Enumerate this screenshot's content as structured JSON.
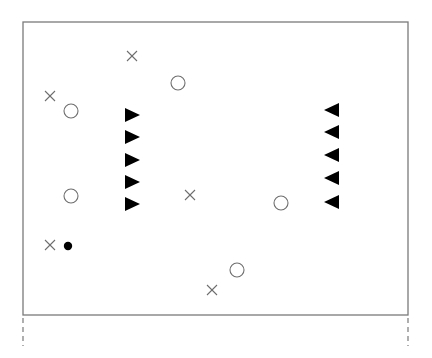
{
  "diagram": {
    "frame": {
      "x1": 23,
      "y1": 22,
      "x2": 408,
      "y2": 315,
      "stroke": "#7a7a7a"
    },
    "dashed_extensions": [
      {
        "x": 23,
        "y1": 318,
        "y2": 346
      },
      {
        "x": 408,
        "y1": 318,
        "y2": 346
      }
    ],
    "crosses": [
      {
        "x": 132,
        "y": 56
      },
      {
        "x": 50,
        "y": 96
      },
      {
        "x": 190,
        "y": 195
      },
      {
        "x": 50,
        "y": 245
      },
      {
        "x": 212,
        "y": 290
      }
    ],
    "open_circles": [
      {
        "x": 178,
        "y": 83
      },
      {
        "x": 71,
        "y": 111
      },
      {
        "x": 71,
        "y": 196
      },
      {
        "x": 281,
        "y": 203
      },
      {
        "x": 237,
        "y": 270
      }
    ],
    "filled_circles": [
      {
        "x": 68,
        "y": 246
      }
    ],
    "right_triangles": [
      {
        "x": 132,
        "y": 115
      },
      {
        "x": 132,
        "y": 137
      },
      {
        "x": 132,
        "y": 160
      },
      {
        "x": 132,
        "y": 182
      },
      {
        "x": 132,
        "y": 204
      }
    ],
    "left_triangles": [
      {
        "x": 332,
        "y": 110
      },
      {
        "x": 332,
        "y": 132
      },
      {
        "x": 332,
        "y": 155
      },
      {
        "x": 332,
        "y": 178
      },
      {
        "x": 332,
        "y": 202
      }
    ],
    "colors": {
      "line": "#7a7a7a",
      "symbol_stroke": "#6e6e6e",
      "fill": "#000000"
    }
  }
}
